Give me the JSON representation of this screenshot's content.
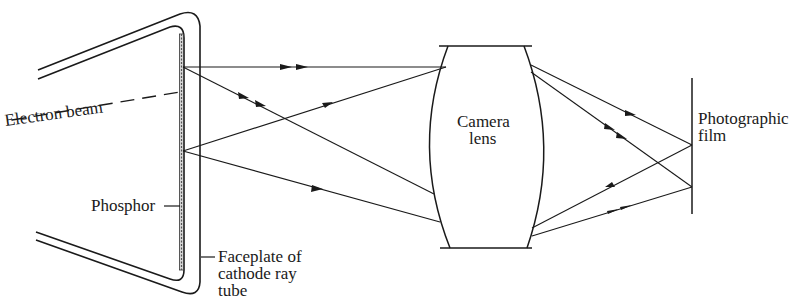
{
  "diagram": {
    "title": "",
    "colors": {
      "ink": "#1a1a1a",
      "background": "#ffffff"
    },
    "labels": {
      "electron_beam": "Electron beam",
      "phosphor": "Phosphor",
      "faceplate_line1": "Faceplate of",
      "faceplate_line2": "cathode ray",
      "faceplate_line3": "tube",
      "camera_lens_line1": "Camera",
      "camera_lens_line2": "lens",
      "film_line1": "Photographic",
      "film_line2": "film"
    },
    "components": [
      {
        "id": "crt",
        "name": "Cathode ray tube (faceplate with phosphor layer)"
      },
      {
        "id": "electron-beam",
        "name": "Electron beam (dashed)"
      },
      {
        "id": "camera-lens",
        "name": "Camera lens (biconvex)"
      },
      {
        "id": "film",
        "name": "Photographic film plane"
      }
    ],
    "rays": [
      {
        "from": "phosphor-point-upper",
        "to": "lens-top",
        "arrows": 2
      },
      {
        "from": "phosphor-point-upper",
        "to": "lens-lower",
        "arrows": 2
      },
      {
        "from": "phosphor-point-lower",
        "to": "lens-top",
        "arrows": 1
      },
      {
        "from": "phosphor-point-lower",
        "to": "lens-bottom",
        "arrows": 1
      },
      {
        "from": "lens-top",
        "to": "film-upper-focus",
        "arrows": 1
      },
      {
        "from": "lens-top",
        "to": "film-lower-focus",
        "arrows": 2
      },
      {
        "from": "lens-bottom",
        "to": "film-upper-focus",
        "arrows": 1
      },
      {
        "from": "lens-bottom",
        "to": "film-lower-focus",
        "arrows": 2
      }
    ]
  }
}
